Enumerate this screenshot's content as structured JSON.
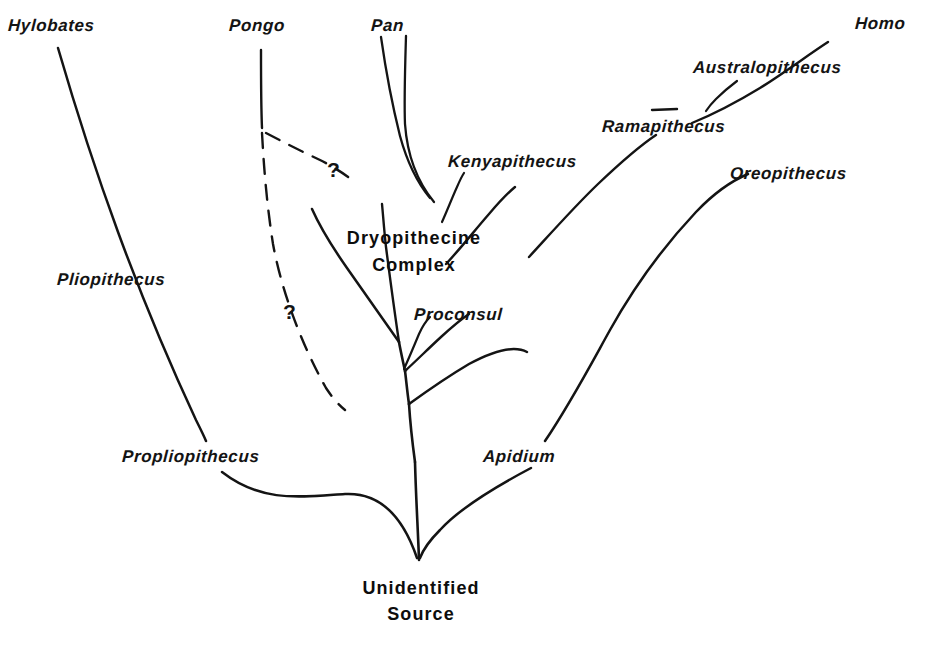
{
  "figure": {
    "kind": "phylogenetic-tree",
    "background_color": "#ffffff",
    "ink_color": "#141414",
    "root_label_line1": "Unidentified",
    "root_label_line2": "Source",
    "node_label_line1": "Dryopithecine",
    "node_label_line2": "Complex",
    "uncertainty_marker_1": "?",
    "uncertainty_marker_2": "?"
  },
  "taxa": [
    {
      "id": "hylobates",
      "label": "Hylobates",
      "x": 8,
      "y": 16
    },
    {
      "id": "pongo",
      "label": "Pongo",
      "x": 229,
      "y": 16
    },
    {
      "id": "pan",
      "label": "Pan",
      "x": 371,
      "y": 16
    },
    {
      "id": "homo",
      "label": "Homo",
      "x": 855,
      "y": 14
    },
    {
      "id": "australopithecus",
      "label": "Australopithecus",
      "x": 693,
      "y": 58
    },
    {
      "id": "ramapithecus",
      "label": "Ramapithecus",
      "x": 602,
      "y": 117
    },
    {
      "id": "kenyapithecus",
      "label": "Kenyapithecus",
      "x": 448,
      "y": 152
    },
    {
      "id": "oreopithecus",
      "label": "Oreopithecus",
      "x": 730,
      "y": 164
    },
    {
      "id": "pliopithecus",
      "label": "Pliopithecus",
      "x": 57,
      "y": 270
    },
    {
      "id": "proconsul",
      "label": "Proconsul",
      "x": 414,
      "y": 305
    },
    {
      "id": "propliopithecus",
      "label": "Propliopithecus",
      "x": 122,
      "y": 447
    },
    {
      "id": "apidium",
      "label": "Apidium",
      "x": 483,
      "y": 447
    }
  ],
  "node_labels": [
    {
      "id": "dryopithecine-complex",
      "line1": "Dryopithecine",
      "line2": "Complex",
      "x": 329,
      "y": 228
    },
    {
      "id": "unidentified-source",
      "line1": "Unidentified",
      "line2": "Source",
      "x": 341,
      "y": 578
    }
  ],
  "markers": [
    {
      "id": "question-upper",
      "text": "?",
      "x": 327,
      "y": 158
    },
    {
      "id": "question-lower",
      "text": "?",
      "x": 283,
      "y": 300
    }
  ]
}
